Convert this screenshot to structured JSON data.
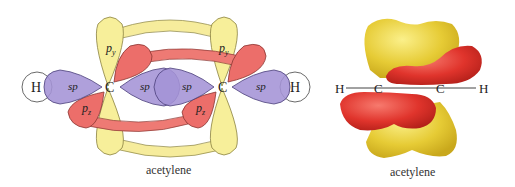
{
  "left_diagram": {
    "caption": "acetylene",
    "atoms": {
      "h_left": "H",
      "c_left": "C",
      "c_right": "C",
      "h_right": "H"
    },
    "orbital_labels": {
      "sp_h_left": "sp",
      "sp_c_left": "sp",
      "sp_c_right_inner": "sp",
      "sp_h_right": "sp",
      "py_left": "p",
      "py_left_sub": "y",
      "py_right": "p",
      "py_right_sub": "y",
      "pz_left": "p",
      "pz_left_sub": "z",
      "pz_right": "p",
      "pz_right_sub": "z"
    },
    "colors": {
      "sp": "#a493d6",
      "py": "#f7ef9a",
      "pz": "#ec6e6a",
      "h": "#ffffff",
      "bond_yellow": "#f6ec9c",
      "bond_red": "#ee7a74"
    }
  },
  "right_diagram": {
    "caption": "acetylene",
    "atoms": {
      "h_left": "H",
      "c_left": "C",
      "c_right": "C",
      "h_right": "H"
    },
    "colors": {
      "lobe_yellow": "#e8cf3c",
      "lobe_red": "#e0332c"
    }
  }
}
